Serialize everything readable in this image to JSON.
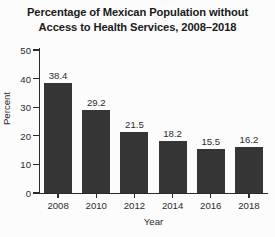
{
  "chart_data": {
    "type": "bar",
    "title": "Percentage of Mexican Population without Access to Health Services, 2008–2018",
    "title_lines": [
      "Percentage of Mexican Population without",
      "Access to Health Services, 2008–2018"
    ],
    "categories": [
      "2008",
      "2010",
      "2012",
      "2014",
      "2016",
      "2018"
    ],
    "values": [
      38.4,
      29.2,
      21.5,
      18.2,
      15.5,
      16.2
    ],
    "value_labels": [
      "38.4",
      "29.2",
      "21.5",
      "18.2",
      "15.5",
      "16.2"
    ],
    "xlabel": "Year",
    "ylabel": "Percent",
    "ylim": [
      0,
      50
    ],
    "yticks": [
      0,
      10,
      20,
      30,
      40,
      50
    ],
    "ytick_labels": [
      "0",
      "10",
      "20",
      "30",
      "40",
      "50"
    ],
    "grid": false,
    "legend": null,
    "bar_color": "#353535",
    "axis_color": "#2b2b2b",
    "background_color": "#fcfcfc"
  }
}
